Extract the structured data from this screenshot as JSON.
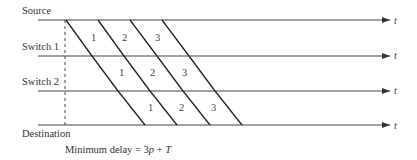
{
  "nodes": [
    {
      "label": "Source",
      "y": 20
    },
    {
      "label": "Switch 1",
      "y": 55
    },
    {
      "label": "Switch 2",
      "y": 90
    },
    {
      "label": "Destination",
      "y": 125
    }
  ],
  "axis_label": "t",
  "packets": [
    "1",
    "2",
    "3"
  ],
  "caption": {
    "prefix": "Minimum delay = 3",
    "var_p": "p",
    "mid": " + ",
    "var_T": "T"
  },
  "colors": {
    "line": "#333333",
    "text": "#333333"
  }
}
